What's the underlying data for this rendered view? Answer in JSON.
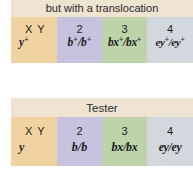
{
  "panels": [
    {
      "header": "but with a translocation",
      "cells": [
        {
          "label": "X  Y",
          "genotype": "y",
          "sup": "+",
          "color": "#f1d3a2"
        },
        {
          "label": "2",
          "genotype_parts": [
            {
              "t": "b",
              "sup": "+"
            },
            {
              "t": "/b",
              "sup": "+"
            }
          ],
          "genotype": "b+/b+",
          "color": "#c7c3de"
        },
        {
          "label": "3",
          "genotype_parts": [
            {
              "t": "bx",
              "sup": "+"
            },
            {
              "t": "/bx",
              "sup": "+"
            }
          ],
          "genotype": "bx+/bx+",
          "color": "#bdd3a9"
        },
        {
          "label": "4",
          "genotype_parts": [
            {
              "t": "ey",
              "sup": "+"
            },
            {
              "t": "/ey",
              "sup": "+"
            }
          ],
          "genotype": "ey+/ey+",
          "color": "#d3d8df"
        }
      ]
    },
    {
      "header": "Tester",
      "cells": [
        {
          "label": "X  Y",
          "genotype": "y",
          "color": "#f1d3a2"
        },
        {
          "label": "2",
          "genotype": "b/b",
          "color": "#c7c3de"
        },
        {
          "label": "3",
          "genotype": "bx/bx",
          "color": "#bdd3a9"
        },
        {
          "label": "4",
          "genotype": "ey/ey",
          "color": "#d3d8df"
        }
      ]
    }
  ],
  "header_color": "#efe3d2",
  "sup_plus": "+",
  "top": {
    "c1": {
      "a": "y"
    },
    "c2": {
      "a": "b",
      "b": "/b"
    },
    "c3": {
      "a": "bx",
      "b": "/bx"
    },
    "c4": {
      "a": "ey",
      "b": "/ey"
    }
  }
}
